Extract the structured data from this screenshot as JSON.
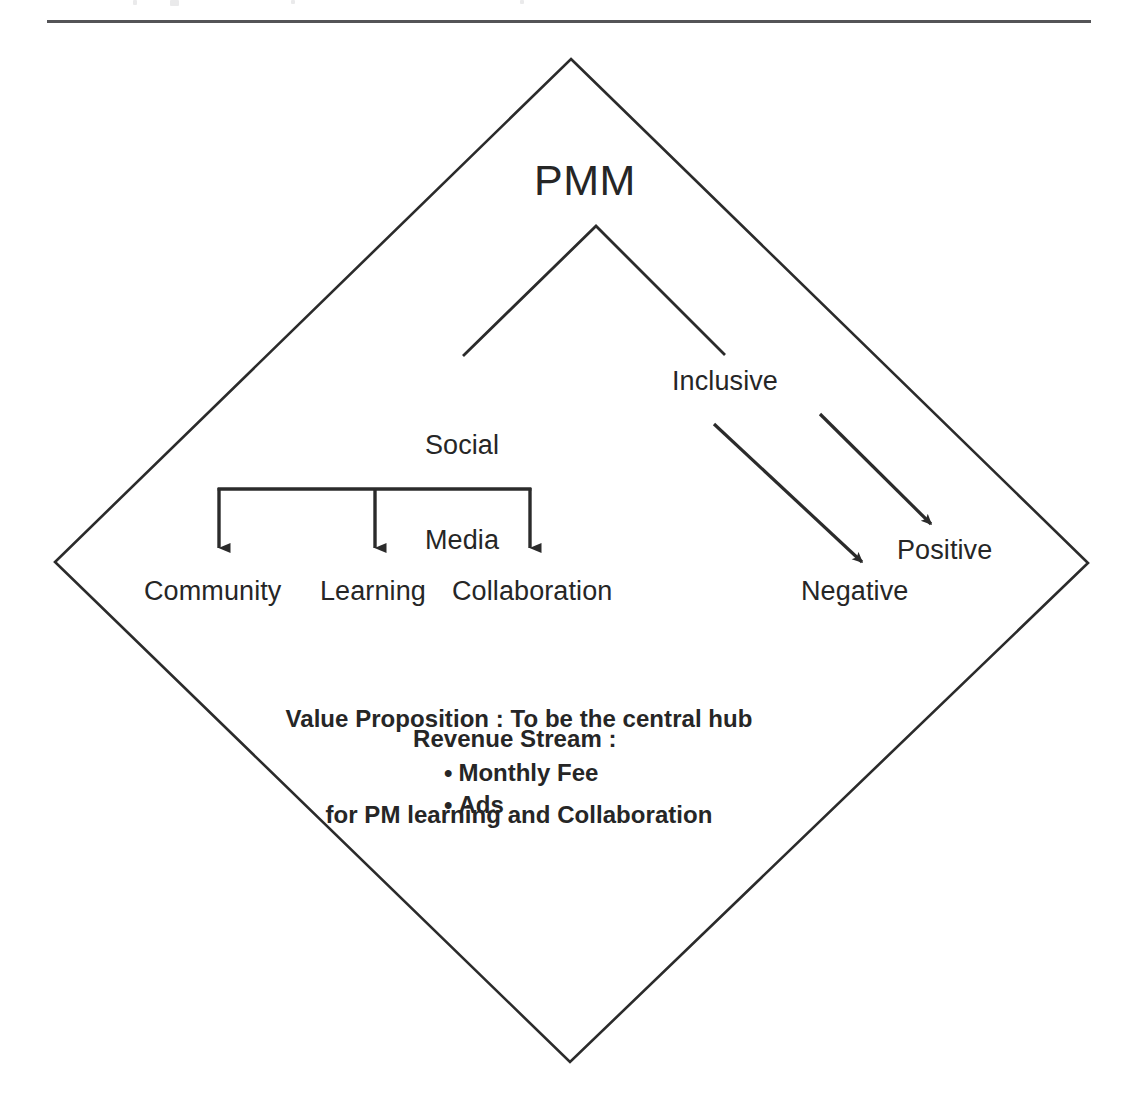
{
  "page": {
    "background_color": "#ffffff",
    "ink_color": "#262626",
    "line_color": "#2b2b2b",
    "rule_color": "#4a4a4a"
  },
  "diagram": {
    "title": "PMM",
    "shape": "diamond",
    "root_label": "PMM",
    "branches": [
      {
        "id": "social-media",
        "label": "Social\nMedia",
        "line1": "Social",
        "line2": "Media"
      },
      {
        "id": "inclusive",
        "label": "Inclusive"
      }
    ],
    "leaves": [
      {
        "id": "community",
        "label": "Community"
      },
      {
        "id": "learning",
        "label": "Learning"
      },
      {
        "id": "collaboration",
        "label": "Collaboration"
      }
    ],
    "outcomes": [
      {
        "id": "negative",
        "label": "Negative"
      },
      {
        "id": "positive",
        "label": "Positive"
      }
    ],
    "value_proposition": {
      "line1": "Value Proposition : To be the central hub",
      "line2": "for PM learning and Collaboration"
    },
    "revenue_stream": {
      "title": "Revenue Stream :",
      "items": [
        {
          "label": "Monthly Fee"
        },
        {
          "label": "Ads"
        }
      ]
    }
  },
  "icons": {
    "arrow_down": "arrow-down-icon",
    "arrow_diagonal": "arrow-diagonal-icon"
  }
}
